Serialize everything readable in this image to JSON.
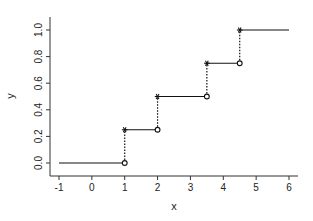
{
  "chart_data": {
    "type": "line",
    "subtype": "step (empirical CDF)",
    "title": "",
    "xlabel": "x",
    "ylabel": "y",
    "xlim": [
      -1.25,
      6.3
    ],
    "ylim": [
      -0.1,
      1.1
    ],
    "grid": false,
    "legend": null,
    "x_ticks": [
      -1,
      0,
      1,
      2,
      3,
      4,
      5,
      6
    ],
    "x_tick_labels": [
      "-1",
      "0",
      "1",
      "2",
      "3",
      "4",
      "5",
      "6"
    ],
    "y_ticks": [
      0.0,
      0.2,
      0.4,
      0.6,
      0.8,
      1.0
    ],
    "y_tick_labels": [
      "0.0",
      "0.2",
      "0.4",
      "0.6",
      "0.8",
      "1.0"
    ],
    "segments": [
      {
        "x_start": -1,
        "x_end": 1,
        "y": 0.0
      },
      {
        "x_start": 1,
        "x_end": 2,
        "y": 0.25
      },
      {
        "x_start": 2,
        "x_end": 3.5,
        "y": 0.5
      },
      {
        "x_start": 3.5,
        "x_end": 4.5,
        "y": 0.75
      },
      {
        "x_start": 4.5,
        "x_end": 6,
        "y": 1.0
      }
    ],
    "jumps": [
      {
        "x": 1,
        "y_from": 0.0,
        "y_to": 0.25
      },
      {
        "x": 2,
        "y_from": 0.25,
        "y_to": 0.5
      },
      {
        "x": 3.5,
        "y_from": 0.5,
        "y_to": 0.75
      },
      {
        "x": 4.5,
        "y_from": 0.75,
        "y_to": 1.0
      }
    ],
    "markers": {
      "closed": "star at top of each jump (right-continuous value)",
      "open": "circle at bottom of each jump (left limit)"
    },
    "styles": {
      "step_line": "solid",
      "jump_line": "dotted",
      "color": "#111111"
    }
  }
}
